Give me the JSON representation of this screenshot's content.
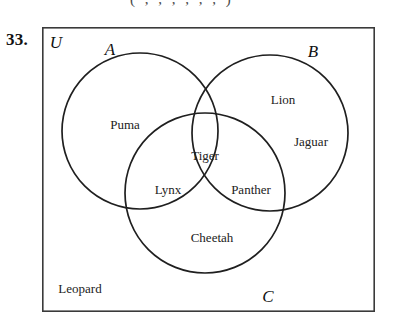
{
  "figure": {
    "problem_number": "33.",
    "clipped_top_line": "( , , , , , , )",
    "universal_label": "U",
    "set_labels": {
      "a": "A",
      "b": "B",
      "c": "C"
    },
    "regions": [
      {
        "id": "a-only",
        "label": "Puma",
        "region": "A only",
        "x": 125,
        "y": 125
      },
      {
        "id": "b-only-1",
        "label": "Lion",
        "region": "B only",
        "x": 283,
        "y": 100
      },
      {
        "id": "b-only-2",
        "label": "Jaguar",
        "region": "B only",
        "x": 311,
        "y": 142
      },
      {
        "id": "a-b-c",
        "label": "Tiger",
        "region": "A and B and C",
        "x": 205,
        "y": 156
      },
      {
        "id": "a-c",
        "label": "Lynx",
        "region": "A and C",
        "x": 168,
        "y": 190
      },
      {
        "id": "b-c",
        "label": "Panther",
        "region": "B and C",
        "x": 251,
        "y": 190
      },
      {
        "id": "c-only",
        "label": "Cheetah",
        "region": "C only",
        "x": 212,
        "y": 238
      },
      {
        "id": "outside",
        "label": "Leopard",
        "region": "outside all sets",
        "x": 80,
        "y": 289
      }
    ],
    "colors": {
      "circle_stroke": "#1f1f1f",
      "rect_stroke": "#3a3a3a",
      "text": "#222222",
      "background": "#ffffff"
    },
    "geometry": {
      "rect": {
        "x": 42,
        "y": 27,
        "width": 333,
        "height": 285
      },
      "circle_a": {
        "cx": 140,
        "cy": 131,
        "r": 78
      },
      "circle_b": {
        "cx": 270,
        "cy": 133,
        "r": 78
      },
      "circle_c": {
        "cx": 205,
        "cy": 193,
        "r": 80
      }
    }
  }
}
